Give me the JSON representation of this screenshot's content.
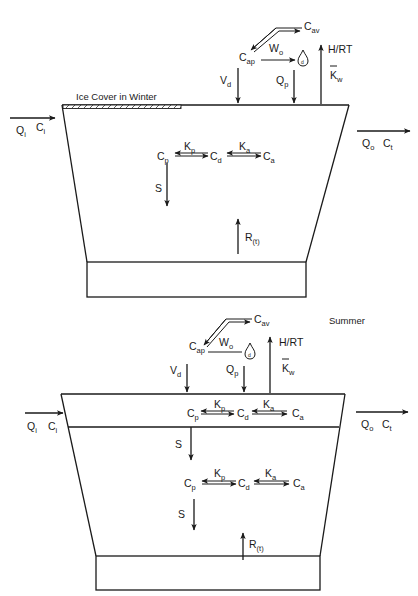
{
  "winter": {
    "ice_label": "Ice Cover in Winter",
    "inflow": {
      "q": "Q",
      "q_sub": "i",
      "c": "C",
      "c_sub": "i"
    },
    "outflow": {
      "q": "Q",
      "q_sub": "o",
      "c": "C",
      "c_sub": "t"
    },
    "atmosphere": {
      "cav": {
        "base": "C",
        "sub": "av"
      },
      "cap": {
        "base": "C",
        "sub": "ap"
      },
      "wo": {
        "base": "W",
        "sub": "o"
      },
      "vd": {
        "base": "V",
        "sub": "d"
      },
      "qp": {
        "base": "Q",
        "sub": "p"
      },
      "hrt": "H/RT",
      "kw": {
        "base": "K",
        "sub": "w"
      }
    },
    "water": {
      "cp": {
        "base": "C",
        "sub": "p"
      },
      "cd": {
        "base": "C",
        "sub": "d"
      },
      "ca": {
        "base": "C",
        "sub": "a"
      },
      "kp": {
        "base": "K",
        "sub": "p"
      },
      "ka": {
        "base": "K",
        "sub": "a"
      },
      "s": "S",
      "r": {
        "base": "R",
        "sub": "(t)"
      }
    }
  },
  "summer": {
    "season_label": "Summer",
    "inflow": {
      "q": "Q",
      "q_sub": "i",
      "c": "C",
      "c_sub": "i"
    },
    "outflow": {
      "q": "Q",
      "q_sub": "o",
      "c": "C",
      "c_sub": "t"
    },
    "atmosphere": {
      "cav": {
        "base": "C",
        "sub": "av"
      },
      "cap": {
        "base": "C",
        "sub": "ap"
      },
      "wo": {
        "base": "W",
        "sub": "o"
      },
      "vd": {
        "base": "V",
        "sub": "d"
      },
      "qp": {
        "base": "Q",
        "sub": "p"
      },
      "hrt": "H/RT",
      "kw": {
        "base": "K",
        "sub": "w"
      }
    },
    "epilimnion": {
      "cp": {
        "base": "C",
        "sub": "p"
      },
      "cd": {
        "base": "C",
        "sub": "d"
      },
      "ca": {
        "base": "C",
        "sub": "a"
      },
      "kp": {
        "base": "K",
        "sub": "p"
      },
      "ka": {
        "base": "K",
        "sub": "a"
      },
      "s": "S"
    },
    "hypolimnion": {
      "cp": {
        "base": "C",
        "sub": "p"
      },
      "cd": {
        "base": "C",
        "sub": "d"
      },
      "ca": {
        "base": "C",
        "sub": "a"
      },
      "kp": {
        "base": "K",
        "sub": "p"
      },
      "ka": {
        "base": "K",
        "sub": "a"
      },
      "s": "S",
      "r": {
        "base": "R",
        "sub": "(t)"
      }
    }
  }
}
